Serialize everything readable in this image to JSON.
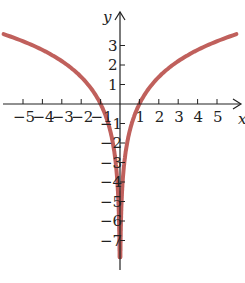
{
  "chart_data": {
    "type": "line",
    "title": "",
    "xlabel": "x",
    "ylabel": "y",
    "x_ticks": [
      -5,
      -4,
      -3,
      -2,
      -1,
      1,
      2,
      3,
      4,
      5
    ],
    "y_ticks": [
      -7,
      -6,
      -5,
      -4,
      -3,
      -2,
      -1,
      1,
      2,
      3
    ],
    "xlim": [
      -6,
      6
    ],
    "ylim": [
      -8,
      4.5
    ],
    "grid": false,
    "series": [
      {
        "name": "y = 2 ln|x|",
        "color": "#c0605c",
        "x": [
          -6,
          -5,
          -4,
          -3,
          -2,
          -1,
          -0.5,
          -0.2,
          -0.05,
          0.05,
          0.2,
          0.5,
          1,
          2,
          3,
          4,
          5,
          6
        ],
        "y": [
          3.58,
          3.22,
          2.77,
          2.2,
          1.39,
          0,
          -1.39,
          -3.22,
          -5.99,
          -5.99,
          -3.22,
          -1.39,
          0,
          1.39,
          2.2,
          2.77,
          3.22,
          3.58
        ]
      }
    ]
  },
  "labels": {
    "x": "x",
    "y": "y"
  }
}
